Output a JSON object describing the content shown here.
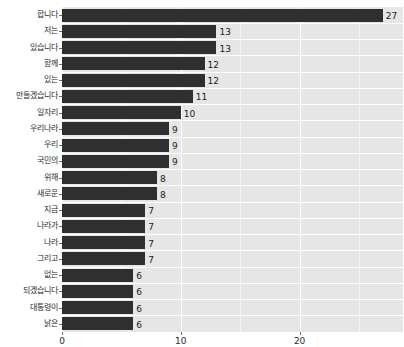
{
  "chart_data": {
    "type": "bar",
    "orientation": "horizontal",
    "title": "",
    "xlabel": "",
    "ylabel": "",
    "xlim": [
      0,
      28.7
    ],
    "ylim": [
      0,
      19
    ],
    "grid": true,
    "legend": false,
    "bar_color": "#2f2f2f",
    "plot_background": "#e6e6e6",
    "gridline_color": "#ffffff",
    "xticks": [
      0,
      10,
      20
    ],
    "xticklabels": [
      "0",
      "10",
      "20"
    ],
    "categories": [
      "합니다",
      "저는",
      "있습니다",
      "함께",
      "있는",
      "만들겠습니다",
      "일자리",
      "우리나라",
      "우리",
      "국민의",
      "위해",
      "새로운",
      "지금",
      "나라가",
      "나라",
      "그리고",
      "없는",
      "되겠습니다",
      "대통령이",
      "낡은"
    ],
    "values": [
      27,
      13,
      13,
      12,
      12,
      11,
      10,
      9,
      9,
      9,
      8,
      8,
      7,
      7,
      7,
      7,
      6,
      6,
      6,
      6
    ],
    "value_labels": [
      "27",
      "13",
      "13",
      "12",
      "12",
      "11",
      "10",
      "9",
      "9",
      "9",
      "8",
      "8",
      "7",
      "7",
      "7",
      "7",
      "6",
      "6",
      "6",
      "6"
    ]
  }
}
